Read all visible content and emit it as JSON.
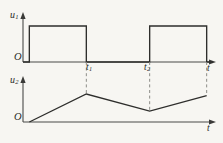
{
  "figure": {
    "background_color": "#f7f6f2",
    "line_color": "#2e2e2c",
    "axis_color": "#4a4a48",
    "dash_color": "#8d8d88",
    "origin_label_top": "O",
    "origin_label_bottom": "O"
  },
  "labels": {
    "u1": "u",
    "u1_sub": "1",
    "u2": "u",
    "u2_sub": "2",
    "t_axis_top": "t",
    "t_axis_bottom": "t",
    "t1": "t",
    "t1_sub": "1",
    "t2": "t",
    "t2_sub": "2"
  },
  "chart_data": [
    {
      "type": "line",
      "name": "u1-pulse-waveform",
      "title": "",
      "xlabel": "t",
      "ylabel": "u1",
      "grid": false,
      "legend": "none",
      "xlim": [
        0,
        6
      ],
      "ylim": [
        0,
        1.3
      ],
      "x_ticks": [
        2,
        4
      ],
      "x_tick_labels": [
        "t1",
        "t2"
      ],
      "description": "Rectangular pulse train: high from 0.2 to 2, low from 2 to 4, high from 4 to 5.8",
      "x": [
        0.0,
        0.2,
        0.2,
        2.0,
        2.0,
        4.0,
        4.0,
        5.8,
        5.8,
        6.0
      ],
      "y": [
        0.0,
        0.0,
        1.0,
        1.0,
        0.0,
        0.0,
        1.0,
        1.0,
        0.0,
        0.0
      ]
    },
    {
      "type": "line",
      "name": "u2-triangular-waveform",
      "title": "",
      "xlabel": "t",
      "ylabel": "u2",
      "grid": false,
      "legend": "none",
      "xlim": [
        0,
        6
      ],
      "ylim": [
        0,
        1.3
      ],
      "x_ticks": [
        2,
        4
      ],
      "x_tick_labels": [
        "t1",
        "t2"
      ],
      "description": "Triangular ramp: rises from origin to peak at t1, falls to valley at t2, rises again to peak at 5.8",
      "x": [
        0.2,
        2.0,
        4.0,
        5.8
      ],
      "y": [
        0.0,
        0.72,
        0.28,
        0.68
      ]
    }
  ],
  "annotations": {
    "dashed_links": [
      {
        "name": "dash-t1",
        "x": 2.0,
        "note": "links u1 falling edge to u2 peak"
      },
      {
        "name": "dash-t2",
        "x": 4.0,
        "note": "links u1 rising edge to u2 valley"
      },
      {
        "name": "dash-t3",
        "x": 5.8,
        "note": "links u1 falling edge to u2 second peak"
      }
    ]
  }
}
